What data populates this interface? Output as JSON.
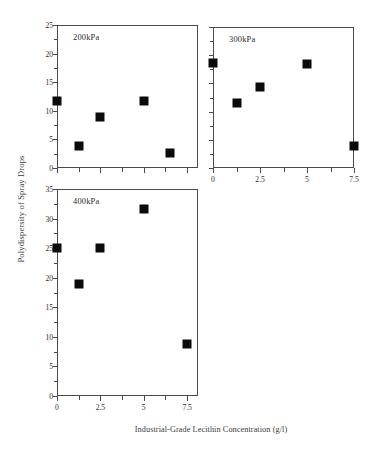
{
  "figure": {
    "xlabel": "Industrial-Grade Lecithin Concentration (g/l)",
    "ylabel": "Polydispersity of Spray Drops"
  },
  "chart_data": [
    {
      "type": "scatter",
      "title": "200kPa",
      "xlabel": "Industrial-Grade Lecithin Concentration (g/l)",
      "ylabel": "Polydispersity of Spray Drops",
      "xlim": [
        0,
        8.125
      ],
      "ylim": [
        0,
        25
      ],
      "xticks": [
        0,
        2.5,
        5,
        7.5
      ],
      "xticklabels": [
        "",
        "",
        "",
        ""
      ],
      "yticks": [
        0,
        5,
        10,
        15,
        20,
        25
      ],
      "yticklabels": [
        "0",
        "5",
        "10",
        "15",
        "20",
        "25"
      ],
      "grid": false,
      "legend": false,
      "marker": "filled-square",
      "color": "#0b0b0b",
      "x": [
        0,
        1.25,
        2.5,
        5,
        6.5
      ],
      "y": [
        11.8,
        3.9,
        9.0,
        11.8,
        2.7
      ]
    },
    {
      "type": "scatter",
      "title": "300kPa",
      "xlabel": "Industrial-Grade Lecithin Concentration (g/l)",
      "ylabel": "Polydispersity of Spray Drops",
      "xlim": [
        0,
        7.5
      ],
      "ylim": [
        0,
        25
      ],
      "xticks": [
        0,
        2.5,
        5,
        7.5
      ],
      "xticklabels": [
        "0",
        "2.5",
        "5",
        "7.5"
      ],
      "yticks": [
        0,
        5,
        10,
        15,
        20,
        25
      ],
      "yticklabels": [
        "",
        "",
        "",
        "",
        "",
        ""
      ],
      "grid": false,
      "legend": false,
      "marker": "filled-square",
      "color": "#0b0b0b",
      "x": [
        0,
        1.25,
        2.5,
        5,
        7.5
      ],
      "y": [
        18.6,
        11.5,
        14.3,
        18.5,
        3.9
      ]
    },
    {
      "type": "scatter",
      "title": "400kPa",
      "xlabel": "Industrial-Grade Lecithin Concentration (g/l)",
      "ylabel": "Polydispersity of Spray Drops",
      "xlim": [
        0,
        8.125
      ],
      "ylim": [
        0,
        35
      ],
      "xticks": [
        0,
        2.5,
        5,
        7.5
      ],
      "xticklabels": [
        "0",
        "2.5",
        "5",
        "7.5"
      ],
      "yticks": [
        0,
        5,
        10,
        15,
        20,
        25,
        30,
        35
      ],
      "yticklabels": [
        "0",
        "5",
        "10",
        "15",
        "20",
        "25",
        "30",
        "35"
      ],
      "grid": false,
      "legend": false,
      "marker": "filled-square",
      "color": "#0b0b0b",
      "x": [
        0,
        1.25,
        2.5,
        5,
        7.5
      ],
      "y": [
        25.0,
        19.0,
        25.0,
        31.7,
        8.8
      ]
    }
  ],
  "panels": [
    {
      "title": "200kPa"
    },
    {
      "title": "300kPa"
    },
    {
      "title": "400kPa"
    }
  ]
}
